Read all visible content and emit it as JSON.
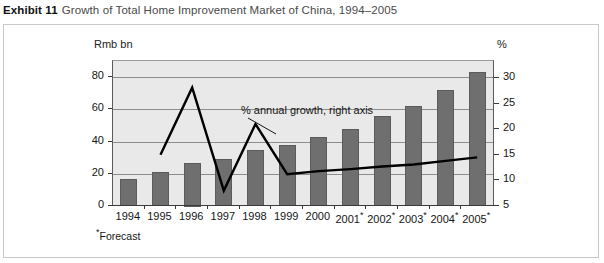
{
  "caption": {
    "exhibit_label": "Exhibit 11",
    "title": "Growth of Total Home Improvement Market of China, 1994–2005"
  },
  "axes": {
    "left_unit": "Rmb bn",
    "right_unit": "%"
  },
  "annotation": {
    "text": "% annual growth, right axis"
  },
  "footnote": {
    "star": "*",
    "text": "Forecast"
  },
  "colors": {
    "bar_fill": "#6f6f6f",
    "bar_stroke": "#5b5b5b",
    "plot_background": "#e9e9e9",
    "gridline": "#8d8d8d",
    "axis": "#3a3a3a",
    "line_series": "#000000",
    "frame_border": "#c9c9c9",
    "caption_title": "#4a4a4a"
  },
  "chart_data": {
    "type": "bar",
    "title": "Growth of Total Home Improvement Market of China, 1994–2005",
    "xlabel": "",
    "ylabel": "Rmb bn",
    "y2label": "%",
    "grid": true,
    "legend_position": "inline-annotation",
    "categories": [
      "1994",
      "1995",
      "1996",
      "1997",
      "1998",
      "1999",
      "2000",
      "2001*",
      "2002*",
      "2003*",
      "2004*",
      "2005*"
    ],
    "forecast_years": [
      "2001*",
      "2002*",
      "2003*",
      "2004*",
      "2005*"
    ],
    "ylim": [
      0,
      90
    ],
    "yticks": [
      0,
      20,
      40,
      60,
      80
    ],
    "y2lim": [
      5,
      33.3
    ],
    "y2ticks": [
      5,
      10,
      15,
      20,
      25,
      30
    ],
    "series": [
      {
        "name": "Total home improvement market",
        "type": "bar",
        "axis": "left",
        "unit": "Rmb bn",
        "values": [
          17,
          21,
          27,
          29,
          35,
          38,
          43,
          48,
          56,
          62,
          72,
          83
        ]
      },
      {
        "name": "% annual growth, right axis",
        "type": "line",
        "axis": "right",
        "unit": "%",
        "values": [
          null,
          15.0,
          28.1,
          8.0,
          21.0,
          11.2,
          11.8,
          12.2,
          12.7,
          13.1,
          13.8,
          14.5
        ]
      }
    ]
  }
}
